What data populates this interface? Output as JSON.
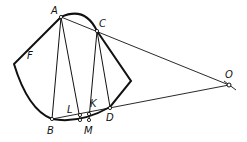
{
  "diagram": {
    "labels": {
      "A": "A",
      "C": "C",
      "F": "F",
      "O": "O",
      "B": "B",
      "L": "L",
      "K": "K",
      "M": "M",
      "D": "D"
    },
    "colors": {
      "stroke": "#111111",
      "background": "#ffffff"
    }
  }
}
